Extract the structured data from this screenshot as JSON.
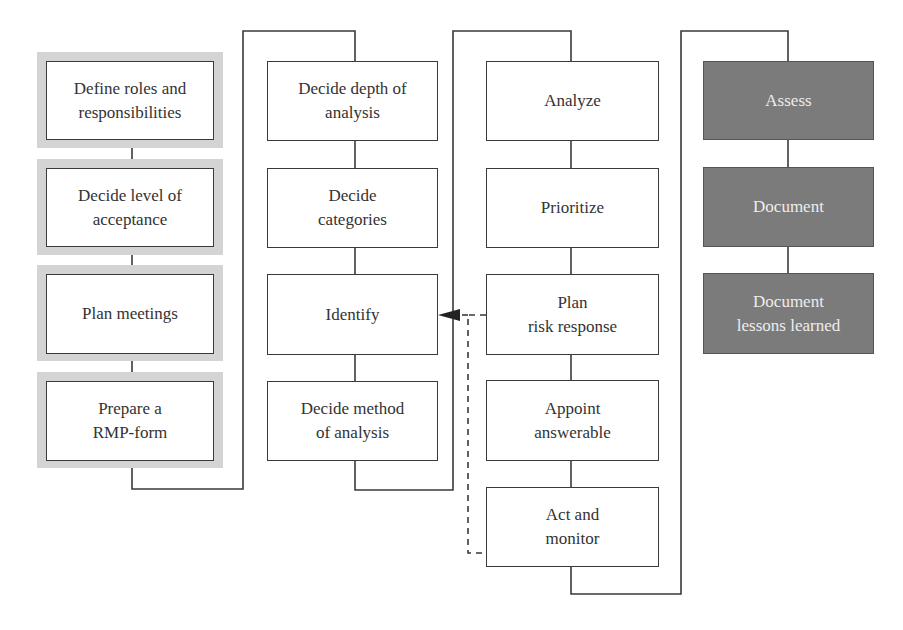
{
  "diagram": {
    "type": "flowchart",
    "colors": {
      "line": "#3a3a3a",
      "box_fill": "#ffffff",
      "shadow_fill": "#d4d4d4",
      "dark_box_fill": "#7b7b7b",
      "dark_box_text": "#ededed"
    },
    "columns": [
      {
        "id": "col1",
        "style": "highlighted",
        "steps": [
          {
            "label": "Define roles and\nresponsibilities"
          },
          {
            "label": "Decide level of\nacceptance"
          },
          {
            "label": "Plan meetings"
          },
          {
            "label": "Prepare a\nRMP-form"
          }
        ]
      },
      {
        "id": "col2",
        "style": "plain",
        "steps": [
          {
            "label": "Decide depth of\nanalysis"
          },
          {
            "label": "Decide\ncategories"
          },
          {
            "label": "Identify"
          },
          {
            "label": "Decide method\nof analysis"
          }
        ]
      },
      {
        "id": "col3",
        "style": "plain",
        "steps": [
          {
            "label": "Analyze"
          },
          {
            "label": "Prioritize"
          },
          {
            "label": "Plan\nrisk response"
          },
          {
            "label": "Appoint\nanswerable"
          },
          {
            "label": "Act and\nmonitor"
          }
        ]
      },
      {
        "id": "col4",
        "style": "dark",
        "steps": [
          {
            "label": "Assess"
          },
          {
            "label": "Document"
          },
          {
            "label": "Document\nlessons learned"
          }
        ]
      }
    ],
    "feedback_loop": {
      "from": [
        "Plan\nrisk response",
        "Act and\nmonitor"
      ],
      "to": "Identify",
      "style": "dashed-arrow"
    }
  }
}
